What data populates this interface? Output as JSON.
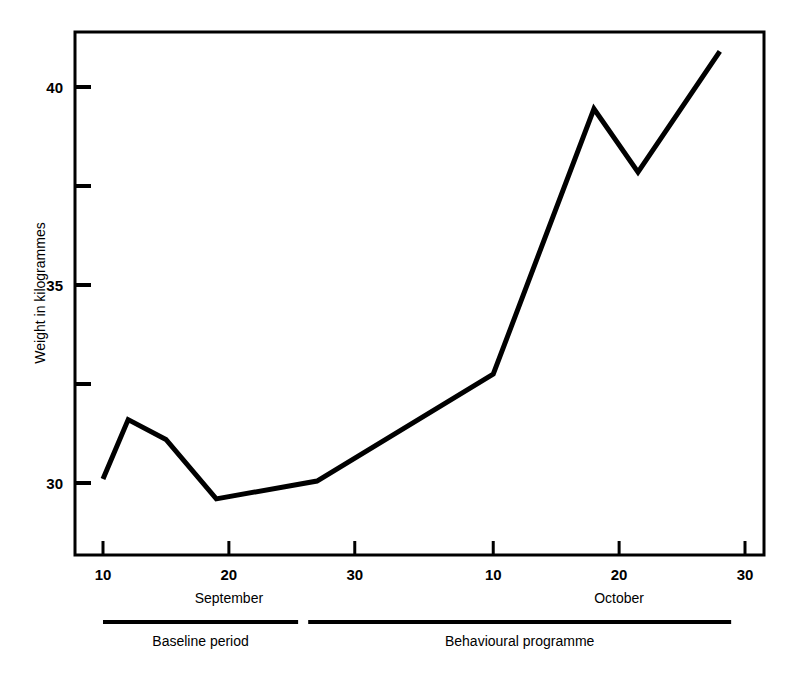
{
  "chart_data": {
    "type": "line",
    "title": "",
    "subtitle": "",
    "xlabel": "",
    "ylabel": "Weight in kilogrammes",
    "ylim": [
      28.5,
      41.5
    ],
    "xlim": [
      9,
      61
    ],
    "grid": false,
    "legend": "none",
    "y_ticks": [
      {
        "value": 30,
        "label": "30",
        "major": true
      },
      {
        "value": 32.5,
        "label": "",
        "major": false
      },
      {
        "value": 35,
        "label": "35",
        "major": true
      },
      {
        "value": 37.5,
        "label": "",
        "major": false
      },
      {
        "value": 40,
        "label": "40",
        "major": true
      }
    ],
    "x_ticks": [
      {
        "value": 10,
        "label": "10"
      },
      {
        "value": 20,
        "label": "20"
      },
      {
        "value": 30,
        "label": "30"
      },
      {
        "value": 41,
        "label": "10"
      },
      {
        "value": 51,
        "label": "20"
      },
      {
        "value": 61,
        "label": "30"
      }
    ],
    "month_labels": [
      {
        "label": "September",
        "at": 20
      },
      {
        "label": "October",
        "at": 51
      }
    ],
    "series": [
      {
        "name": "Weight",
        "x": [
          10,
          12,
          15,
          19,
          27,
          41,
          49,
          52.5,
          59
        ],
        "values": [
          30.1,
          31.6,
          31.1,
          29.6,
          30.05,
          32.75,
          39.45,
          37.85,
          40.9
        ]
      }
    ],
    "annotations": [
      {
        "label": "Baseline period",
        "x_start": 10,
        "x_end": 25.5
      },
      {
        "label": "Behavioural programme",
        "x_start": 26.3,
        "x_end": 59.9
      }
    ]
  },
  "figure": {
    "line_color": "#000000",
    "axis_color": "#000000",
    "background": "#ffffff"
  }
}
